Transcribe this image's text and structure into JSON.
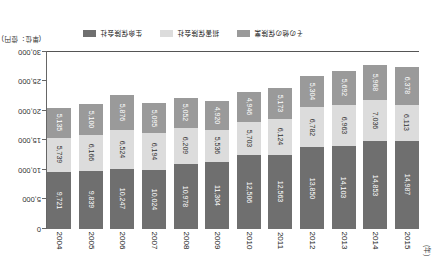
{
  "chart_data": {
    "type": "bar",
    "stacked": true,
    "title": "",
    "xlabel": "(年)",
    "ylabel": "",
    "unit_note": "(単位：億円)",
    "ylim": [
      0,
      30000
    ],
    "grid": false,
    "legend_position": "bottom",
    "categories": [
      "2004",
      "2005",
      "2006",
      "2007",
      "2008",
      "2009",
      "2010",
      "2011",
      "2012",
      "2013",
      "2014",
      "2015"
    ],
    "ytick_labels": [
      "0",
      "5,000",
      "10,000",
      "15,000",
      "20,000",
      "25,000",
      "30,000"
    ],
    "ytick_values": [
      0,
      5000,
      10000,
      15000,
      20000,
      25000,
      30000
    ],
    "series": [
      {
        "name": "生命保険会社",
        "color": "#6f6f6f",
        "values": [
          9721,
          9839,
          10247,
          10024,
          10978,
          11304,
          12506,
          12563,
          13850,
          14103,
          14853,
          14987
        ],
        "value_labels": [
          "9,721",
          "9,839",
          "10,247",
          "10,024",
          "10,978",
          "11,304",
          "12,506",
          "12,563",
          "13,850",
          "14,103",
          "14,853",
          "14,987"
        ]
      },
      {
        "name": "損害保険会社",
        "color": "#dcdcdc",
        "values": [
          5739,
          6166,
          6524,
          6194,
          6209,
          5536,
          5703,
          6124,
          6782,
          6963,
          7036,
          6113
        ],
        "value_labels": [
          "5,739",
          "6,166",
          "6,524",
          "6,194",
          "6,209",
          "5,536",
          "5,703",
          "6,124",
          "6,782",
          "6,963",
          "7,036",
          "6,113"
        ]
      },
      {
        "name": "その他の保険業",
        "color": "#9a9a9a",
        "values": [
          5135,
          5100,
          5876,
          5095,
          5052,
          4920,
          4946,
          5173,
          5304,
          5692,
          5968,
          6378
        ],
        "value_labels": [
          "5,135",
          "5,100",
          "5,876",
          "5,095",
          "5,052",
          "4,920",
          "4,946",
          "5,173",
          "5,304",
          "5,692",
          "5,968",
          "6,378"
        ]
      }
    ]
  },
  "legend": {
    "items": [
      {
        "label": "生命保険会社",
        "color": "#6f6f6f"
      },
      {
        "label": "損害保険会社",
        "color": "#dcdcdc"
      },
      {
        "label": "その他の保険業",
        "color": "#9a9a9a"
      }
    ]
  },
  "axis": {
    "x_caption": "(年)",
    "unit_note": "(単位：億円)"
  },
  "colors": {
    "series_1": "#6f6f6f",
    "series_2": "#dcdcdc",
    "series_3": "#9a9a9a",
    "axis": "#555555",
    "background": "#ffffff"
  }
}
